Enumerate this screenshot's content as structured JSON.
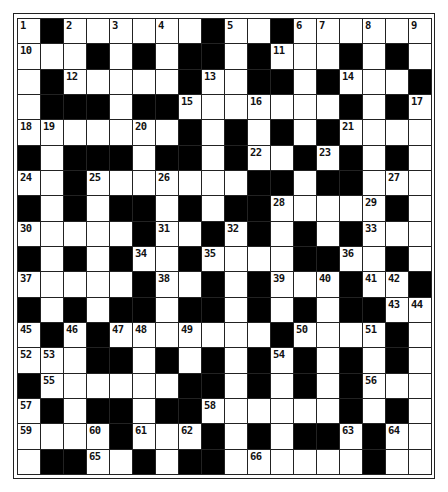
{
  "puzzle": {
    "rows": 18,
    "cols": 18,
    "colors": {
      "block": "#000000",
      "cell": "#ffffff",
      "line": "#222222"
    },
    "grid": [
      "W.WWWWWW.WW.WWWWWW",
      "WWW.W.W..W.WWW.W.W",
      "W.WWWWW.WW..W.WWW.",
      "W...W..WWWWWWW.W.W",
      "WWWWWWW.W.W.W.WWWW",
      ".W...W..W.WW.W.W.W",
      "WW.WWWWWWW..W..WW",
      ".W.W..W.W..WWWWW.W",
      "WWWWW.WW.W.W.W.WWW",
      ".W.W.WW.WWWW..WW.W",
      "WWWWW.WW.W.WWW.WW.",
      ".W.W..W..W.W.W..WW",
      "W.W.WWWWWWW.WWWW.W",
      "WWW..W.W.W.W.W.W.W",
      ".WWWWWW..W.W.W.WWW",
      "W.W..W..WWWWWW.W.W",
      "WWWW.WWW.W.W..W.WW",
      "W..WW.W..WWWWWW.W"
    ],
    "numbers": [
      {
        "r": 0,
        "c": 0,
        "n": "1"
      },
      {
        "r": 0,
        "c": 2,
        "n": "2"
      },
      {
        "r": 0,
        "c": 4,
        "n": "3"
      },
      {
        "r": 0,
        "c": 6,
        "n": "4"
      },
      {
        "r": 0,
        "c": 9,
        "n": "5"
      },
      {
        "r": 0,
        "c": 12,
        "n": "6"
      },
      {
        "r": 0,
        "c": 13,
        "n": "7"
      },
      {
        "r": 0,
        "c": 15,
        "n": "8"
      },
      {
        "r": 0,
        "c": 17,
        "n": "9"
      },
      {
        "r": 1,
        "c": 0,
        "n": "10"
      },
      {
        "r": 1,
        "c": 11,
        "n": "11"
      },
      {
        "r": 2,
        "c": 2,
        "n": "12"
      },
      {
        "r": 2,
        "c": 8,
        "n": "13"
      },
      {
        "r": 2,
        "c": 14,
        "n": "14"
      },
      {
        "r": 3,
        "c": 7,
        "n": "15"
      },
      {
        "r": 3,
        "c": 10,
        "n": "16"
      },
      {
        "r": 3,
        "c": 17,
        "n": "17"
      },
      {
        "r": 4,
        "c": 0,
        "n": "18"
      },
      {
        "r": 4,
        "c": 1,
        "n": "19"
      },
      {
        "r": 4,
        "c": 5,
        "n": "20"
      },
      {
        "r": 4,
        "c": 14,
        "n": "21"
      },
      {
        "r": 5,
        "c": 10,
        "n": "22"
      },
      {
        "r": 5,
        "c": 13,
        "n": "23"
      },
      {
        "r": 6,
        "c": 0,
        "n": "24"
      },
      {
        "r": 6,
        "c": 3,
        "n": "25"
      },
      {
        "r": 6,
        "c": 6,
        "n": "26"
      },
      {
        "r": 6,
        "c": 16,
        "n": "27"
      },
      {
        "r": 7,
        "c": 11,
        "n": "28"
      },
      {
        "r": 7,
        "c": 15,
        "n": "29"
      },
      {
        "r": 8,
        "c": 0,
        "n": "30"
      },
      {
        "r": 8,
        "c": 6,
        "n": "31"
      },
      {
        "r": 8,
        "c": 9,
        "n": "32"
      },
      {
        "r": 8,
        "c": 15,
        "n": "33"
      },
      {
        "r": 9,
        "c": 5,
        "n": "34"
      },
      {
        "r": 9,
        "c": 8,
        "n": "35"
      },
      {
        "r": 9,
        "c": 14,
        "n": "36"
      },
      {
        "r": 10,
        "c": 0,
        "n": "37"
      },
      {
        "r": 10,
        "c": 6,
        "n": "38"
      },
      {
        "r": 10,
        "c": 11,
        "n": "39"
      },
      {
        "r": 10,
        "c": 13,
        "n": "40"
      },
      {
        "r": 10,
        "c": 15,
        "n": "41"
      },
      {
        "r": 10,
        "c": 16,
        "n": "42"
      },
      {
        "r": 11,
        "c": 16,
        "n": "43"
      },
      {
        "r": 11,
        "c": 17,
        "n": "44"
      },
      {
        "r": 12,
        "c": 0,
        "n": "45"
      },
      {
        "r": 12,
        "c": 2,
        "n": "46"
      },
      {
        "r": 12,
        "c": 4,
        "n": "47"
      },
      {
        "r": 12,
        "c": 5,
        "n": "48"
      },
      {
        "r": 12,
        "c": 7,
        "n": "49"
      },
      {
        "r": 12,
        "c": 12,
        "n": "50"
      },
      {
        "r": 12,
        "c": 15,
        "n": "51"
      },
      {
        "r": 13,
        "c": 0,
        "n": "52"
      },
      {
        "r": 13,
        "c": 1,
        "n": "53"
      },
      {
        "r": 13,
        "c": 11,
        "n": "54"
      },
      {
        "r": 14,
        "c": 1,
        "n": "55"
      },
      {
        "r": 14,
        "c": 15,
        "n": "56"
      },
      {
        "r": 15,
        "c": 0,
        "n": "57"
      },
      {
        "r": 15,
        "c": 8,
        "n": "58"
      },
      {
        "r": 16,
        "c": 0,
        "n": "59"
      },
      {
        "r": 16,
        "c": 3,
        "n": "60"
      },
      {
        "r": 16,
        "c": 5,
        "n": "61"
      },
      {
        "r": 16,
        "c": 7,
        "n": "62"
      },
      {
        "r": 16,
        "c": 14,
        "n": "63"
      },
      {
        "r": 16,
        "c": 16,
        "n": "64"
      },
      {
        "r": 17,
        "c": 3,
        "n": "65"
      },
      {
        "r": 17,
        "c": 10,
        "n": "66"
      }
    ]
  }
}
